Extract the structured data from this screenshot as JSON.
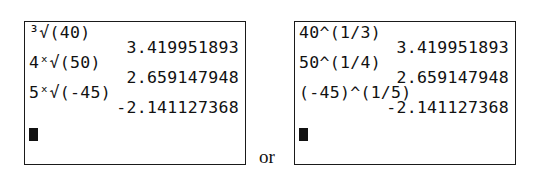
{
  "screens": {
    "left": {
      "lines": [
        {
          "type": "input",
          "text": "³√(40)"
        },
        {
          "type": "result",
          "text": "3.419951893"
        },
        {
          "type": "input",
          "text": "4ˣ√(50)"
        },
        {
          "type": "result",
          "text": "2.659147948"
        },
        {
          "type": "input",
          "text": "5ˣ√(-45)"
        },
        {
          "type": "result",
          "text": "-2.141127368"
        }
      ]
    },
    "right": {
      "lines": [
        {
          "type": "input",
          "text": "40^(1/3)"
        },
        {
          "type": "result",
          "text": "3.419951893"
        },
        {
          "type": "input",
          "text": "50^(1/4)"
        },
        {
          "type": "result",
          "text": "2.659147948"
        },
        {
          "type": "input",
          "text": "(-45)^(1/5)"
        },
        {
          "type": "result",
          "text": "-2.141127368"
        }
      ]
    }
  },
  "separator_label": "or"
}
